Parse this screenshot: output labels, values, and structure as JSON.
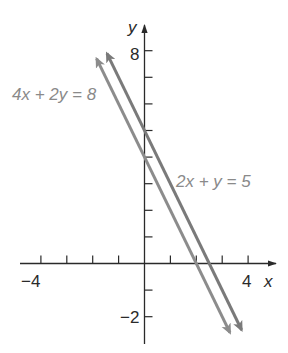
{
  "chart_data": {
    "type": "line",
    "title": "",
    "xlabel": "x",
    "ylabel": "y",
    "xlim": [
      -5,
      5
    ],
    "ylim": [
      -3,
      9
    ],
    "x_ticks": [
      -4,
      -3,
      -2,
      -1,
      1,
      2,
      3,
      4
    ],
    "y_ticks": [
      -2,
      -1,
      1,
      2,
      3,
      4,
      5,
      6,
      7,
      8
    ],
    "x_tick_labels": [
      {
        "value": -4,
        "label": "−4"
      },
      {
        "value": 4,
        "label": "4"
      }
    ],
    "y_tick_labels": [
      {
        "value": 8,
        "label": "8"
      },
      {
        "value": -2,
        "label": "−2"
      }
    ],
    "grid": false,
    "legend": "none (inline labels)",
    "series": [
      {
        "name": "4x + 2y = 8",
        "equation": "y = 4 - 2x",
        "color": "#8c8c8c",
        "x": [
          -1.85,
          3.3
        ],
        "y": [
          7.7,
          -2.6
        ],
        "arrows": "both"
      },
      {
        "name": "2x + y = 5",
        "equation": "y = 5 - 2x",
        "color": "#7a7a7a",
        "x": [
          -1.45,
          3.75
        ],
        "y": [
          7.9,
          -2.5
        ],
        "arrows": "both"
      }
    ],
    "annotations": [
      {
        "text": "4x + 2y = 8",
        "position": "upper-left of lines"
      },
      {
        "text": "2x + y = 5",
        "position": "right of lines, near y=3"
      }
    ]
  },
  "labels": {
    "x_axis_name": "x",
    "y_axis_name": "y",
    "x_min_label": "−4",
    "x_max_label": "4",
    "y_max_label": "8",
    "y_min_label": "−2",
    "eq1": "4x + 2y = 8",
    "eq2": "2x + y = 5"
  },
  "colors": {
    "axis": "#2a2a2a",
    "line1": "#8c8c8c",
    "line2": "#7a7a7a",
    "label": "#8a8a8a"
  }
}
